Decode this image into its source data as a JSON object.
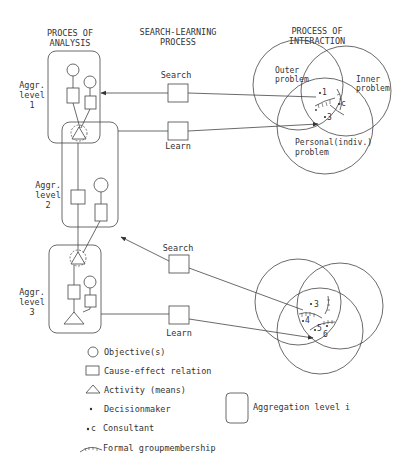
{
  "headers": {
    "analysis": [
      "PROCES OF",
      "ANALYSIS"
    ],
    "search_learning": [
      "SEARCH-LEARNING",
      "PROCESS"
    ],
    "interaction": [
      "PROCESS OF",
      "INTERACTION"
    ]
  },
  "levels": [
    {
      "label": [
        "Aggr.",
        "level",
        "1"
      ]
    },
    {
      "label": [
        "Aggr.",
        "level",
        "2"
      ]
    },
    {
      "label": [
        "Aggr.",
        "level",
        "3"
      ]
    }
  ],
  "search_learning": {
    "top_search": "Search",
    "top_learn": "Learn",
    "bottom_search": "Search",
    "bottom_learn": "Learn"
  },
  "venn_top": {
    "outer": [
      "Outer",
      "problem"
    ],
    "inner": [
      "Inner",
      "problem"
    ],
    "personal": [
      "Personal(indiv.)",
      "problem"
    ],
    "members": [
      "1",
      "c",
      "3"
    ]
  },
  "venn_bottom": {
    "members": [
      "3",
      "4",
      "5",
      "6"
    ]
  },
  "legend": {
    "objective": "Objective(s)",
    "cause_effect": "Cause-effect relation",
    "activity": "Activity (means)",
    "decisionmaker": "Decisionmaker",
    "consultant_symbol": "c",
    "consultant": "Consultant",
    "group": "Formal groupmembership",
    "aggregation": "Aggregation level i"
  }
}
